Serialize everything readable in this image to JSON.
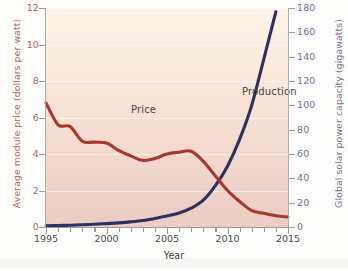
{
  "chart_data": {
    "type": "line",
    "title": "",
    "xlabel": "Year",
    "xlim": [
      1995,
      2015
    ],
    "xticks": [
      1995,
      2000,
      2005,
      2010,
      2015
    ],
    "grid": true,
    "legend_position": "inline-annotations",
    "axes": [
      {
        "id": "left",
        "label": "Average module price (dollars per watt)",
        "color": "#b0675f",
        "lim": [
          0,
          12
        ],
        "ticks": [
          0,
          2,
          4,
          6,
          8,
          10,
          12
        ]
      },
      {
        "id": "right",
        "label": "Global solar power capacity (gigawatts)",
        "color": "#6d7391",
        "lim": [
          0,
          180
        ],
        "ticks": [
          0,
          20,
          40,
          60,
          80,
          100,
          120,
          140,
          160,
          180
        ]
      }
    ],
    "series": [
      {
        "name": "Price",
        "axis": "left",
        "color": "#a8382e",
        "unit": "dollars per watt",
        "x": [
          1995,
          1996,
          1997,
          1998,
          1999,
          2000,
          2001,
          2002,
          2003,
          2004,
          2005,
          2006,
          2007,
          2008,
          2009,
          2010,
          2011,
          2012,
          2013,
          2014,
          2015
        ],
        "values": [
          6.8,
          5.6,
          5.5,
          4.7,
          4.65,
          4.6,
          4.2,
          3.9,
          3.65,
          3.75,
          4.0,
          4.1,
          4.15,
          3.6,
          2.8,
          2.0,
          1.4,
          0.9,
          0.75,
          0.62,
          0.55
        ]
      },
      {
        "name": "Production",
        "axis": "right",
        "color": "#2b3160",
        "unit": "gigawatts",
        "x": [
          1995,
          1996,
          1997,
          1998,
          1999,
          2000,
          2001,
          2002,
          2003,
          2004,
          2005,
          2006,
          2007,
          2008,
          2009,
          2010,
          2011,
          2012,
          2013,
          2014
        ],
        "values": [
          1,
          1.2,
          1.5,
          1.8,
          2.2,
          2.8,
          3.4,
          4.2,
          5.3,
          7.0,
          9.0,
          11.5,
          15.5,
          22,
          34,
          50,
          72,
          100,
          138,
          177
        ]
      }
    ],
    "annotations": [
      {
        "text": "Price",
        "x": 2000,
        "y": 5.2,
        "axis": "left"
      },
      {
        "text": "Production",
        "x": 2009.2,
        "y": 120,
        "axis": "right"
      }
    ]
  },
  "ticks": {
    "left": [
      "12",
      "10",
      "8",
      "6",
      "4",
      "2",
      "0"
    ],
    "right": [
      "180",
      "160",
      "140",
      "120",
      "100",
      "80",
      "60",
      "40",
      "20",
      "0"
    ],
    "x": [
      "1995",
      "2000",
      "2005",
      "2010",
      "2015"
    ]
  },
  "titles": {
    "y_left": "Average module price (dollars per watt)",
    "y_right": "Global solar power capacity (gigawatts)",
    "x": "Year"
  },
  "labels": {
    "price": "Price",
    "production": "Production"
  },
  "colors": {
    "price_line": "#a8382e",
    "production_line": "#2b3160",
    "left_axis_text": "#b0675f",
    "right_axis_text": "#6d7391",
    "plot_bg_top": "#fbf3e6",
    "plot_bg_bottom": "#ecccc3"
  }
}
